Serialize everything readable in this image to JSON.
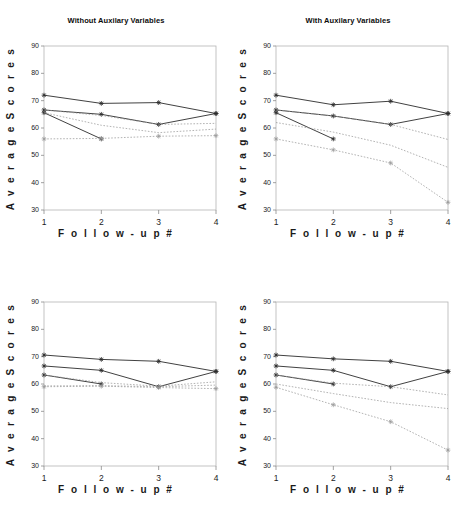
{
  "figure": {
    "width": 464,
    "height": 512,
    "background": "#ffffff"
  },
  "axis": {
    "ylabel": "A v e r a g e   S c o r e s",
    "xlabel": "F o l l o w - u p   #",
    "yticks": [
      "30",
      "40",
      "50",
      "60",
      "70",
      "80",
      "90"
    ],
    "xticks": [
      "1",
      "2",
      "3",
      "4"
    ],
    "frame_color": "#b4b4b4",
    "solid_color": "#2b2b2b",
    "dashed_color": "#9a9a9a"
  },
  "panels": [
    {
      "id": "top-left",
      "title": "Without Auxilary Variables"
    },
    {
      "id": "top-right",
      "title": "With Auxilary Variables"
    },
    {
      "id": "bottom-left",
      "title": ""
    },
    {
      "id": "bottom-right",
      "title": ""
    }
  ],
  "chart_data": [
    {
      "type": "line",
      "panel": "top-left",
      "title": "Without Auxilary Variables",
      "xlabel": "Follow-up #",
      "ylabel": "Average Scores",
      "x": [
        1,
        2,
        3,
        4
      ],
      "xlim": [
        1,
        4
      ],
      "ylim": [
        30,
        90
      ],
      "grid": false,
      "legend": "none",
      "series": [
        {
          "name": "observed-1",
          "style": "solid",
          "marker": "plus",
          "values": [
            72.0,
            69.0,
            69.3,
            65.3
          ]
        },
        {
          "name": "observed-2",
          "style": "solid",
          "marker": "plus",
          "values": [
            66.6,
            65.0,
            61.3,
            65.3
          ]
        },
        {
          "name": "observed-3",
          "style": "solid",
          "marker": "plus",
          "values": [
            65.6,
            56.0,
            null,
            null
          ]
        },
        {
          "name": "imputed-1",
          "style": "dashed",
          "marker": "none",
          "values": [
            66.6,
            64.6,
            61.3,
            61.7
          ]
        },
        {
          "name": "imputed-2",
          "style": "dashed",
          "marker": "none",
          "values": [
            65.6,
            61.0,
            58.3,
            59.6
          ]
        },
        {
          "name": "imputed-3",
          "style": "dashed",
          "marker": "plus",
          "values": [
            56.0,
            56.2,
            57.0,
            57.2
          ]
        }
      ]
    },
    {
      "type": "line",
      "panel": "top-right",
      "title": "With Auxilary Variables",
      "xlabel": "Follow-up #",
      "ylabel": "Average Scores",
      "x": [
        1,
        2,
        3,
        4
      ],
      "xlim": [
        1,
        4
      ],
      "ylim": [
        30,
        90
      ],
      "grid": false,
      "legend": "none",
      "series": [
        {
          "name": "observed-1",
          "style": "solid",
          "marker": "plus",
          "values": [
            72.0,
            68.5,
            69.8,
            65.3
          ]
        },
        {
          "name": "observed-2",
          "style": "solid",
          "marker": "plus",
          "values": [
            66.6,
            64.4,
            61.3,
            65.3
          ]
        },
        {
          "name": "observed-3",
          "style": "solid",
          "marker": "plus",
          "values": [
            65.6,
            56.0,
            null,
            null
          ]
        },
        {
          "name": "imputed-1",
          "style": "dashed",
          "marker": "none",
          "values": [
            66.6,
            64.4,
            61.3,
            55.8
          ]
        },
        {
          "name": "imputed-2",
          "style": "dashed",
          "marker": "none",
          "values": [
            62.0,
            58.5,
            53.7,
            45.6
          ]
        },
        {
          "name": "imputed-3",
          "style": "dashed",
          "marker": "plus",
          "values": [
            56.0,
            52.0,
            47.2,
            32.8
          ]
        }
      ]
    },
    {
      "type": "line",
      "panel": "bottom-left",
      "title": "",
      "xlabel": "Follow-up #",
      "ylabel": "Average Scores",
      "x": [
        1,
        2,
        3,
        4
      ],
      "xlim": [
        1,
        4
      ],
      "ylim": [
        30,
        90
      ],
      "grid": false,
      "legend": "none",
      "series": [
        {
          "name": "observed-1",
          "style": "solid",
          "marker": "plus",
          "values": [
            70.6,
            69.0,
            68.3,
            64.6
          ]
        },
        {
          "name": "observed-2",
          "style": "solid",
          "marker": "plus",
          "values": [
            66.6,
            65.0,
            59.0,
            64.6
          ]
        },
        {
          "name": "observed-3",
          "style": "solid",
          "marker": "plus",
          "values": [
            63.3,
            60.0,
            null,
            null
          ]
        },
        {
          "name": "imputed-1",
          "style": "dashed",
          "marker": "none",
          "values": [
            63.3,
            60.5,
            59.2,
            60.8
          ]
        },
        {
          "name": "imputed-2",
          "style": "dashed",
          "marker": "none",
          "values": [
            59.3,
            59.4,
            59.0,
            59.6
          ]
        },
        {
          "name": "imputed-3",
          "style": "dashed",
          "marker": "plus",
          "values": [
            59.0,
            59.2,
            58.7,
            58.3
          ]
        }
      ]
    },
    {
      "type": "line",
      "panel": "bottom-right",
      "title": "",
      "xlabel": "Follow-up #",
      "ylabel": "Average Scores",
      "x": [
        1,
        2,
        3,
        4
      ],
      "xlim": [
        1,
        4
      ],
      "ylim": [
        30,
        90
      ],
      "grid": false,
      "legend": "none",
      "series": [
        {
          "name": "observed-1",
          "style": "solid",
          "marker": "plus",
          "values": [
            70.6,
            69.2,
            68.3,
            64.6
          ]
        },
        {
          "name": "observed-2",
          "style": "solid",
          "marker": "plus",
          "values": [
            66.6,
            65.0,
            59.0,
            64.6
          ]
        },
        {
          "name": "observed-3",
          "style": "solid",
          "marker": "plus",
          "values": [
            63.3,
            60.0,
            null,
            null
          ]
        },
        {
          "name": "imputed-1",
          "style": "dashed",
          "marker": "none",
          "values": [
            63.3,
            60.3,
            59.0,
            56.0
          ]
        },
        {
          "name": "imputed-2",
          "style": "dashed",
          "marker": "none",
          "values": [
            60.0,
            56.5,
            53.2,
            51.0
          ]
        },
        {
          "name": "imputed-3",
          "style": "dashed",
          "marker": "plus",
          "values": [
            58.8,
            52.4,
            46.2,
            35.8
          ]
        }
      ]
    }
  ]
}
